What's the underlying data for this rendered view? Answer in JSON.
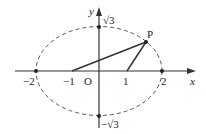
{
  "diagram": {
    "type": "ellipse-with-foci",
    "axes": {
      "x_label": "x",
      "y_label": "y",
      "origin_label": "O"
    },
    "ellipse": {
      "a": 2,
      "b_label": "√3",
      "style": "dashed",
      "color": "#555555"
    },
    "points": [
      {
        "name": "vertex-left",
        "label": "−2",
        "x": -2,
        "y": 0
      },
      {
        "name": "focus-left",
        "label": "−1",
        "x": -1,
        "y": 0
      },
      {
        "name": "focus-right",
        "label": "1",
        "x": 1,
        "y": 0
      },
      {
        "name": "vertex-right",
        "label": "2",
        "x": 2,
        "y": 0
      },
      {
        "name": "co-vertex-top",
        "label": "√3",
        "x": 0,
        "y": 1.732
      },
      {
        "name": "co-vertex-bottom",
        "label": "−√3",
        "x": 0,
        "y": -1.732
      },
      {
        "name": "point-p",
        "label": "P",
        "x": 1.5,
        "y": 1.2
      }
    ],
    "segments": [
      {
        "from": "focus-left",
        "to": "point-p"
      },
      {
        "from": "focus-right",
        "to": "point-p"
      }
    ],
    "colors": {
      "axis": "#333333",
      "segment": "#333333",
      "ellipse": "#555555",
      "text": "#222222"
    }
  }
}
